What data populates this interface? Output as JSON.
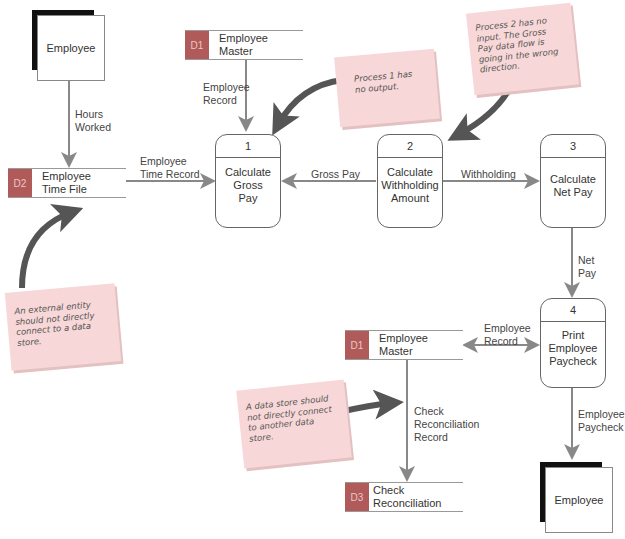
{
  "colors": {
    "store_id_bg": "#b05a5a",
    "flow_arrow": "#888888",
    "callout_arrow": "#555555",
    "sticky_note": "#f7d7d7"
  },
  "entities": [
    {
      "id": "entity-top",
      "label": "Employee"
    },
    {
      "id": "entity-bottom",
      "label": "Employee"
    }
  ],
  "data_stores": [
    {
      "id": "D1",
      "name": "Employee\nMaster",
      "position": "top"
    },
    {
      "id": "D2",
      "name": "Employee\nTime File"
    },
    {
      "id": "D1",
      "name": "Employee\nMaster",
      "position": "bottom"
    },
    {
      "id": "D3",
      "name": "Check\nReconciliation"
    }
  ],
  "processes": [
    {
      "number": "1",
      "label": "Calculate\nGross\nPay"
    },
    {
      "number": "2",
      "label": "Calculate\nWithholding\nAmount"
    },
    {
      "number": "3",
      "label": "Calculate\nNet Pay"
    },
    {
      "number": "4",
      "label": "Print\nEmployee\nPaycheck"
    }
  ],
  "flows": [
    {
      "label": "Hours\nWorked",
      "from": "Employee",
      "to": "D2 Employee Time File"
    },
    {
      "label": "Employee\nRecord",
      "from": "D1 Employee Master",
      "to": "Process 1"
    },
    {
      "label": "Employee\nTime Record",
      "from": "D2 Employee Time File",
      "to": "Process 1"
    },
    {
      "label": "Gross Pay",
      "from": "Process 2",
      "to": "Process 1"
    },
    {
      "label": "Withholding",
      "from": "Process 2",
      "to": "Process 3"
    },
    {
      "label": "Net\nPay",
      "from": "Process 3",
      "to": "Process 4"
    },
    {
      "label": "Employee\nRecord",
      "from": "Process 4",
      "to": "D1 Employee Master",
      "bidirectional": true
    },
    {
      "label": "Check\nReconciliation\nRecord",
      "from": "D1 Employee Master",
      "to": "D3 Check Reconciliation"
    },
    {
      "label": "Employee\nPaycheck",
      "from": "Process 4",
      "to": "Employee"
    }
  ],
  "notes": [
    {
      "text": "Process 1 has\nno output."
    },
    {
      "text": "Process 2 has no\ninput. The Gross\nPay data flow is\ngoing in the wrong\ndirection."
    },
    {
      "text": "An external entity\nshould not directly\nconnect to a data\nstore."
    },
    {
      "text": "A data store should\nnot directly connect\nto another data\nstore."
    }
  ]
}
